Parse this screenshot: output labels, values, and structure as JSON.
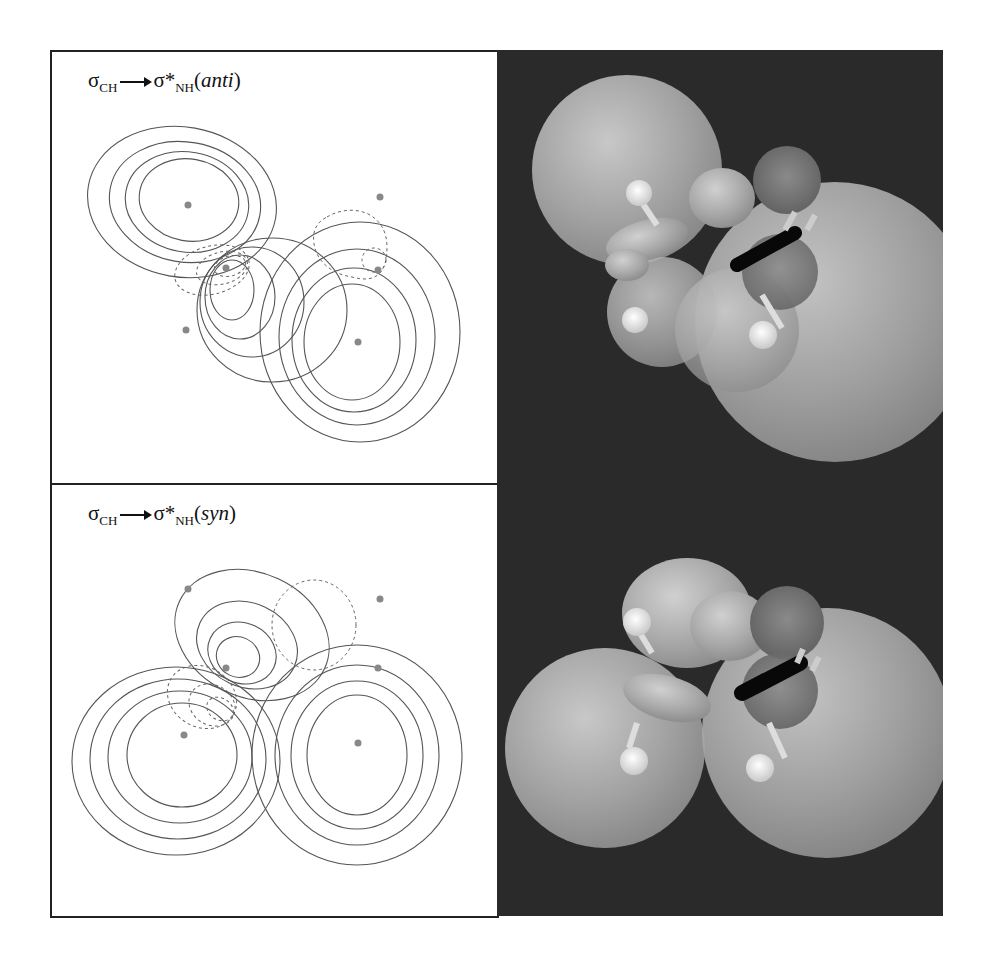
{
  "figure": {
    "panels": [
      {
        "id": "anti",
        "label": {
          "sigma_left": "σ",
          "sub_left": "CH",
          "arrow": "→",
          "sigma_right": "σ*",
          "sub_right": "NH",
          "paren_open": "(",
          "qualifier": "anti",
          "paren_close": ")"
        },
        "plot_type": "contour-map",
        "render_3d": "orbital-isosurface"
      },
      {
        "id": "syn",
        "label": {
          "sigma_left": "σ",
          "sub_left": "CH",
          "arrow": "→",
          "sigma_right": "σ*",
          "sub_right": "NH",
          "paren_open": "(",
          "qualifier": "syn",
          "paren_close": ")"
        },
        "plot_type": "contour-map",
        "render_3d": "orbital-isosurface"
      }
    ],
    "colors": {
      "frame": "#222222",
      "contour_line": "#555555",
      "render_background": "#2a2a2a",
      "lobe_light": "#b8b8b8",
      "lobe_dark": "#6a6a6a",
      "atom_white": "#f2f2f2"
    }
  }
}
